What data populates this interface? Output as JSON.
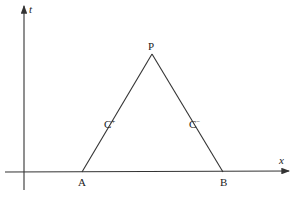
{
  "diagram": {
    "type": "characteristics-triangle",
    "axes": {
      "horizontal": {
        "label": "x"
      },
      "vertical": {
        "label": "t"
      }
    },
    "points": {
      "apex": {
        "label": "P"
      },
      "left_base": {
        "label": "A"
      },
      "right_base": {
        "label": "B"
      }
    },
    "curves": {
      "left": {
        "label": "C",
        "sup": "+"
      },
      "right": {
        "label": "C",
        "sup": "−"
      }
    },
    "colors": {
      "stroke": "#333333",
      "background": "#ffffff"
    }
  }
}
